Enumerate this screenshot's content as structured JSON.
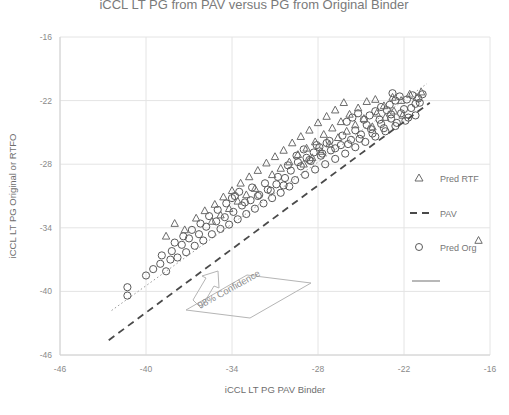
{
  "chart_data": {
    "type": "scatter",
    "title": "iCCL LT PG from PAV versus PG from Original Binder",
    "xlabel": "iCCL LT PG PAV Binder",
    "ylabel": "iCCL LT PG Original or RTFO",
    "xlim": [
      -46,
      -16
    ],
    "ylim": [
      -46,
      -16
    ],
    "xticks": [
      "-46",
      "-40",
      "-34",
      "-28",
      "-22",
      "-16"
    ],
    "yticks": [
      "-16",
      "-22",
      "-28",
      "-34",
      "-40",
      "-46"
    ],
    "xtick_values": [
      -46,
      -40,
      -34,
      -28,
      -22,
      -16
    ],
    "ytick_values": [
      -16,
      -22,
      -28,
      -34,
      -40,
      -46
    ],
    "grid": true,
    "legend_position": "right",
    "annotations": [
      {
        "text": "98% Confidence",
        "x": -32.5,
        "y": -41.0,
        "rotation": -27
      }
    ],
    "legend": [
      {
        "label": "Pred RTF",
        "marker": "triangle"
      },
      {
        "label": "PAV",
        "marker": "dashed-line"
      },
      {
        "label": "Pred Org",
        "marker": "circle"
      },
      {
        "label": "",
        "marker": "solid-line"
      }
    ],
    "reference_line": {
      "name": "PAV",
      "style": "dashed",
      "x": [
        -42.6,
        -20.2
      ],
      "y": [
        -44.6,
        -22.2
      ]
    },
    "fit_line": {
      "name": "fit",
      "style": "dotted",
      "x": [
        -42.4,
        -20.4
      ],
      "y": [
        -41.8,
        -20.4
      ]
    },
    "series": [
      {
        "name": "Pred Org",
        "marker": "circle",
        "points": [
          [
            -41.3,
            -39.6
          ],
          [
            -41.3,
            -40.4
          ],
          [
            -39.0,
            -37.4
          ],
          [
            -38.6,
            -38.1
          ],
          [
            -38.3,
            -37.0
          ],
          [
            -38.9,
            -36.6
          ],
          [
            -38.2,
            -36.2
          ],
          [
            -37.8,
            -36.8
          ],
          [
            -37.5,
            -35.6
          ],
          [
            -37.2,
            -36.3
          ],
          [
            -37.0,
            -35.0
          ],
          [
            -36.6,
            -35.7
          ],
          [
            -36.3,
            -34.6
          ],
          [
            -36.0,
            -35.2
          ],
          [
            -35.8,
            -33.9
          ],
          [
            -35.4,
            -34.6
          ],
          [
            -35.1,
            -33.4
          ],
          [
            -34.8,
            -34.1
          ],
          [
            -34.5,
            -33.0
          ],
          [
            -34.2,
            -33.7
          ],
          [
            -33.9,
            -32.5
          ],
          [
            -33.6,
            -33.2
          ],
          [
            -33.3,
            -31.9
          ],
          [
            -33.0,
            -32.7
          ],
          [
            -32.7,
            -31.4
          ],
          [
            -32.4,
            -32.2
          ],
          [
            -32.1,
            -30.9
          ],
          [
            -31.8,
            -31.7
          ],
          [
            -31.5,
            -30.4
          ],
          [
            -31.2,
            -31.2
          ],
          [
            -30.9,
            -29.9
          ],
          [
            -30.6,
            -30.7
          ],
          [
            -30.3,
            -29.3
          ],
          [
            -30.0,
            -30.1
          ],
          [
            -34.0,
            -31.2
          ],
          [
            -33.5,
            -30.6
          ],
          [
            -33.1,
            -31.6
          ],
          [
            -32.6,
            -30.2
          ],
          [
            -32.2,
            -31.0
          ],
          [
            -31.7,
            -29.8
          ],
          [
            -31.3,
            -30.5
          ],
          [
            -30.8,
            -29.2
          ],
          [
            -30.4,
            -30.0
          ],
          [
            -29.9,
            -28.6
          ],
          [
            -29.6,
            -29.5
          ],
          [
            -29.2,
            -28.2
          ],
          [
            -28.9,
            -29.0
          ],
          [
            -28.5,
            -27.7
          ],
          [
            -28.2,
            -28.5
          ],
          [
            -27.8,
            -27.2
          ],
          [
            -27.5,
            -28.0
          ],
          [
            -27.1,
            -26.7
          ],
          [
            -26.8,
            -27.5
          ],
          [
            -26.4,
            -26.2
          ],
          [
            -26.1,
            -27.0
          ],
          [
            -25.7,
            -25.7
          ],
          [
            -25.4,
            -26.4
          ],
          [
            -25.0,
            -25.2
          ],
          [
            -24.7,
            -25.9
          ],
          [
            -24.3,
            -24.7
          ],
          [
            -24.0,
            -25.4
          ],
          [
            -23.6,
            -24.2
          ],
          [
            -23.3,
            -24.9
          ],
          [
            -22.9,
            -23.7
          ],
          [
            -22.6,
            -24.4
          ],
          [
            -22.2,
            -23.2
          ],
          [
            -21.9,
            -23.9
          ],
          [
            -21.5,
            -22.7
          ],
          [
            -21.2,
            -23.4
          ],
          [
            -20.9,
            -22.2
          ],
          [
            -29.5,
            -27.2
          ],
          [
            -29.0,
            -26.6
          ],
          [
            -28.6,
            -27.6
          ],
          [
            -28.1,
            -26.2
          ],
          [
            -27.7,
            -27.0
          ],
          [
            -27.2,
            -25.8
          ],
          [
            -26.8,
            -26.5
          ],
          [
            -26.3,
            -25.3
          ],
          [
            -25.9,
            -26.1
          ],
          [
            -25.4,
            -24.8
          ],
          [
            -25.1,
            -25.6
          ],
          [
            -24.6,
            -24.3
          ],
          [
            -24.2,
            -25.1
          ],
          [
            -23.7,
            -23.8
          ],
          [
            -23.4,
            -24.6
          ],
          [
            -22.9,
            -23.3
          ],
          [
            -22.5,
            -24.1
          ],
          [
            -22.0,
            -22.8
          ],
          [
            -21.7,
            -23.6
          ],
          [
            -21.2,
            -22.3
          ],
          [
            -23.0,
            -22.4
          ],
          [
            -22.6,
            -22.0
          ],
          [
            -22.3,
            -21.6
          ],
          [
            -21.8,
            -21.9
          ],
          [
            -21.4,
            -21.5
          ],
          [
            -21.0,
            -21.8
          ],
          [
            -20.7,
            -21.4
          ],
          [
            -22.8,
            -21.3
          ],
          [
            -26.0,
            -24.0
          ],
          [
            -25.6,
            -23.6
          ],
          [
            -25.2,
            -23.2
          ],
          [
            -24.8,
            -23.8
          ],
          [
            -24.4,
            -23.4
          ],
          [
            -24.0,
            -23.0
          ],
          [
            -23.6,
            -22.6
          ],
          [
            -23.2,
            -22.9
          ],
          [
            -36.8,
            -34.2
          ],
          [
            -36.2,
            -33.6
          ],
          [
            -35.6,
            -32.9
          ],
          [
            -35.0,
            -32.3
          ],
          [
            -34.4,
            -31.7
          ],
          [
            -33.8,
            -31.0
          ],
          [
            -30.1,
            -28.1
          ],
          [
            -29.4,
            -27.8
          ],
          [
            -28.8,
            -27.4
          ],
          [
            -28.3,
            -26.9
          ],
          [
            -27.9,
            -26.4
          ],
          [
            -27.4,
            -26.0
          ],
          [
            -40.0,
            -38.5
          ],
          [
            -39.5,
            -37.9
          ],
          [
            -38.0,
            -35.4
          ],
          [
            -37.4,
            -34.8
          ]
        ]
      },
      {
        "name": "Pred RTF",
        "marker": "triangle",
        "points": [
          [
            -38.0,
            -33.6
          ],
          [
            -37.3,
            -34.2
          ],
          [
            -36.5,
            -33.1
          ],
          [
            -35.9,
            -32.4
          ],
          [
            -35.2,
            -31.8
          ],
          [
            -34.6,
            -31.1
          ],
          [
            -34.0,
            -30.5
          ],
          [
            -33.4,
            -29.8
          ],
          [
            -32.8,
            -29.2
          ],
          [
            -32.2,
            -28.6
          ],
          [
            -31.6,
            -27.9
          ],
          [
            -31.0,
            -27.3
          ],
          [
            -30.4,
            -26.7
          ],
          [
            -29.8,
            -26.0
          ],
          [
            -29.2,
            -25.4
          ],
          [
            -28.6,
            -24.8
          ],
          [
            -28.0,
            -24.1
          ],
          [
            -27.4,
            -23.5
          ],
          [
            -26.8,
            -22.9
          ],
          [
            -26.2,
            -22.2
          ],
          [
            -31.2,
            -29.0
          ],
          [
            -30.6,
            -28.4
          ],
          [
            -30.0,
            -27.8
          ],
          [
            -29.4,
            -27.1
          ],
          [
            -28.8,
            -26.5
          ],
          [
            -28.2,
            -25.9
          ],
          [
            -27.6,
            -25.2
          ],
          [
            -27.0,
            -24.6
          ],
          [
            -26.4,
            -24.0
          ],
          [
            -25.8,
            -23.3
          ],
          [
            -25.2,
            -22.7
          ],
          [
            -24.6,
            -22.1
          ],
          [
            -24.0,
            -21.9
          ],
          [
            -23.4,
            -22.5
          ],
          [
            -22.8,
            -21.7
          ],
          [
            -22.2,
            -22.0
          ],
          [
            -21.6,
            -21.4
          ],
          [
            -21.1,
            -21.7
          ],
          [
            -20.8,
            -21.2
          ],
          [
            -23.9,
            -23.2
          ],
          [
            -23.3,
            -23.6
          ],
          [
            -22.7,
            -23.0
          ],
          [
            -22.1,
            -23.4
          ],
          [
            -35.4,
            -33.4
          ],
          [
            -34.8,
            -32.8
          ],
          [
            -34.2,
            -32.2
          ],
          [
            -33.6,
            -31.5
          ],
          [
            -33.0,
            -30.9
          ],
          [
            -32.4,
            -30.3
          ],
          [
            -29.0,
            -28.0
          ],
          [
            -28.4,
            -27.4
          ],
          [
            -27.8,
            -26.8
          ],
          [
            -27.2,
            -26.1
          ],
          [
            -26.6,
            -25.5
          ],
          [
            -26.0,
            -24.9
          ],
          [
            -38.6,
            -34.8
          ],
          [
            -25.4,
            -24.3
          ],
          [
            -24.8,
            -23.7
          ],
          [
            -24.2,
            -24.5
          ],
          [
            -16.8,
            -35.2
          ]
        ]
      }
    ]
  },
  "legend": {
    "item_0_label": "Pred RTF",
    "item_1_label": "PAV",
    "item_2_label": "Pred Org",
    "item_3_label": ""
  },
  "annotation": {
    "confidence_label": "98% Confidence"
  },
  "colors": {
    "marker": "#595959",
    "pav_line": "#4a4a4a",
    "fit_line": "#9a9a9a",
    "grid": "#e4e4e4",
    "text": "#6e6e6e"
  }
}
